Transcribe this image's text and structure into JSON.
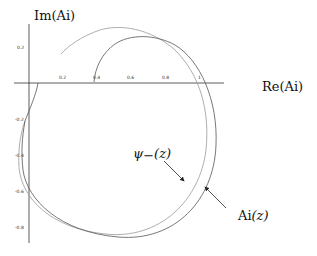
{
  "diagram": {
    "axes": {
      "x_label": "Re(Ai)",
      "y_label": "Im(Ai)",
      "x_ticks": [
        "0.2",
        "0.4",
        "0.6",
        "0.8",
        "1"
      ],
      "y_ticks": [
        "0.2",
        "-0.2",
        "-0.4",
        "-0.6",
        "-0.8"
      ]
    },
    "curves": [
      {
        "name": "psi_minus",
        "label_main": "ψ",
        "label_sub": "−",
        "label_arg": "(z)",
        "color": "#888888"
      },
      {
        "name": "airy",
        "label_main": "Ai",
        "label_arg": "(z)",
        "color": "#444444"
      }
    ]
  }
}
